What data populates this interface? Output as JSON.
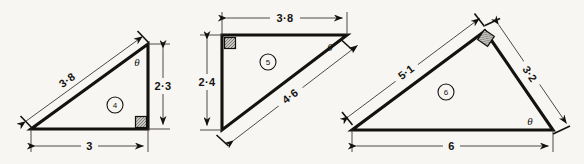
{
  "figure": {
    "background_color": "#f7f6f2",
    "ink_color": "#14120f",
    "angle_symbol": "θ",
    "triangles": [
      {
        "tag": "4",
        "labels": {
          "hypotenuse": "3·8",
          "vertical": "2·3",
          "base": "3",
          "angle": "θ"
        },
        "right_angle_at": "bottom-right",
        "angle_at": "top-right"
      },
      {
        "tag": "5",
        "labels": {
          "top": "3·8",
          "vertical": "2·4",
          "hypotenuse": "4·6",
          "angle": "θ"
        },
        "right_angle_at": "top-left",
        "angle_at": "top-right"
      },
      {
        "tag": "6",
        "labels": {
          "left": "5·1",
          "right": "3·2",
          "base": "6",
          "angle": "θ"
        },
        "right_angle_at": "apex",
        "angle_at": "bottom-right"
      }
    ]
  }
}
